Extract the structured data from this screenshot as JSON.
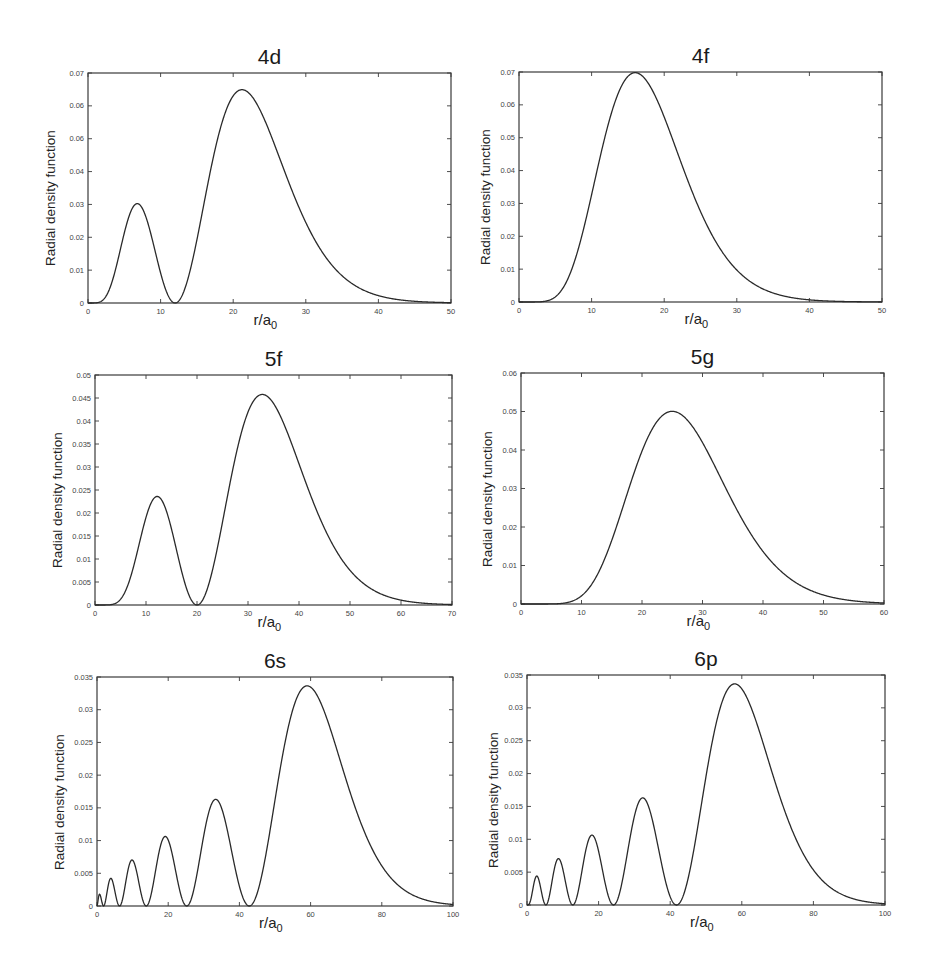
{
  "chart_data": [
    {
      "type": "line",
      "title": "4d",
      "n": 4,
      "l": 2,
      "xlabel": "r/a0",
      "ylabel": "Radial density function",
      "xlim": [
        0,
        50
      ],
      "ylim": [
        0,
        0.07
      ],
      "xticks": [
        0,
        10,
        20,
        30,
        40,
        50
      ],
      "yticks": [
        "0",
        "0.01",
        "0.02",
        "0.03",
        "0.04",
        "0.05",
        "0.06",
        "0.07"
      ],
      "ytick_labels_as_printed": [
        "0",
        "0.01",
        "0.02",
        "0.03",
        "0.04",
        "0.06",
        "0.06",
        "0.07"
      ],
      "peaks": [
        {
          "x": 6.5,
          "y": 0.03
        },
        {
          "x": 21,
          "y": 0.065
        }
      ],
      "nodes": [
        12
      ],
      "grid": false,
      "frame": {
        "left": 88,
        "top": 73,
        "right": 451,
        "bottom": 303
      }
    },
    {
      "type": "line",
      "title": "4f",
      "n": 4,
      "l": 3,
      "xlabel": "r/a0",
      "ylabel": "Radial density function",
      "xlim": [
        0,
        50
      ],
      "ylim": [
        0,
        0.07
      ],
      "xticks": [
        0,
        10,
        20,
        30,
        40,
        50
      ],
      "yticks": [
        "0",
        "0.01",
        "0.02",
        "0.03",
        "0.04",
        "0.05",
        "0.06",
        "0.07"
      ],
      "peaks": [
        {
          "x": 16,
          "y": 0.07
        }
      ],
      "nodes": [],
      "grid": false,
      "frame": {
        "left": 519,
        "top": 72,
        "right": 882,
        "bottom": 302
      }
    },
    {
      "type": "line",
      "title": "5f",
      "n": 5,
      "l": 3,
      "xlabel": "r/a0",
      "ylabel": "Radial density function",
      "xlim": [
        0,
        70
      ],
      "ylim": [
        0,
        0.05
      ],
      "xticks": [
        0,
        10,
        20,
        30,
        40,
        50,
        60,
        70
      ],
      "yticks": [
        "0",
        "0.005",
        "0.01",
        "0.015",
        "0.02",
        "0.025",
        "0.03",
        "0.035",
        "0.04",
        "0.045",
        "0.05"
      ],
      "peaks": [
        {
          "x": 12,
          "y": 0.0235
        },
        {
          "x": 32.5,
          "y": 0.046
        }
      ],
      "nodes": [
        20
      ],
      "grid": false,
      "frame": {
        "left": 95,
        "top": 375,
        "right": 452,
        "bottom": 605
      }
    },
    {
      "type": "line",
      "title": "5g",
      "n": 5,
      "l": 4,
      "xlabel": "r/a0",
      "ylabel": "Radial density function",
      "xlim": [
        0,
        60
      ],
      "ylim": [
        0,
        0.06
      ],
      "xticks": [
        0,
        10,
        20,
        30,
        40,
        50,
        60
      ],
      "yticks": [
        "0",
        "0.01",
        "0.02",
        "0.03",
        "0.04",
        "0.05",
        "0.06"
      ],
      "peaks": [
        {
          "x": 25,
          "y": 0.05
        }
      ],
      "nodes": [],
      "grid": false,
      "frame": {
        "left": 521,
        "top": 373,
        "right": 884,
        "bottom": 604
      }
    },
    {
      "type": "line",
      "title": "6s",
      "n": 6,
      "l": 0,
      "xlabel": "r/a0",
      "ylabel": "Radial density function",
      "xlim": [
        0,
        100
      ],
      "ylim": [
        0,
        0.035
      ],
      "xticks": [
        0,
        20,
        40,
        60,
        80,
        100
      ],
      "yticks": [
        "0",
        "0.005",
        "0.01",
        "0.015",
        "0.02",
        "0.025",
        "0.03",
        "0.035"
      ],
      "peaks": [
        {
          "x": 0.5,
          "y": 0.0018
        },
        {
          "x": 3.5,
          "y": 0.0042
        },
        {
          "x": 9.5,
          "y": 0.007
        },
        {
          "x": 19,
          "y": 0.0106
        },
        {
          "x": 33,
          "y": 0.0164
        },
        {
          "x": 58.5,
          "y": 0.0338
        }
      ],
      "nodes": [
        1.5,
        6,
        14,
        25,
        42.5
      ],
      "grid": false,
      "frame": {
        "left": 97,
        "top": 677,
        "right": 453,
        "bottom": 906
      }
    },
    {
      "type": "line",
      "title": "6p",
      "n": 6,
      "l": 1,
      "xlabel": "r/a0",
      "ylabel": "Radial density function",
      "xlim": [
        0,
        100
      ],
      "ylim": [
        0,
        0.035
      ],
      "xticks": [
        0,
        20,
        40,
        60,
        80,
        100
      ],
      "yticks": [
        "0",
        "0.005",
        "0.01",
        "0.015",
        "0.02",
        "0.025",
        "0.03",
        "0.035"
      ],
      "peaks": [
        {
          "x": 2.5,
          "y": 0.0044
        },
        {
          "x": 8.5,
          "y": 0.007
        },
        {
          "x": 18,
          "y": 0.0106
        },
        {
          "x": 32,
          "y": 0.0164
        },
        {
          "x": 57.5,
          "y": 0.0337
        }
      ],
      "nodes": [
        5,
        12.5,
        24,
        41
      ],
      "grid": false,
      "frame": {
        "left": 527,
        "top": 675,
        "right": 885,
        "bottom": 905
      }
    }
  ],
  "style": {
    "line_color": "#2a2a2a",
    "frame_color": "#3a3a3a",
    "background": "#ffffff"
  }
}
